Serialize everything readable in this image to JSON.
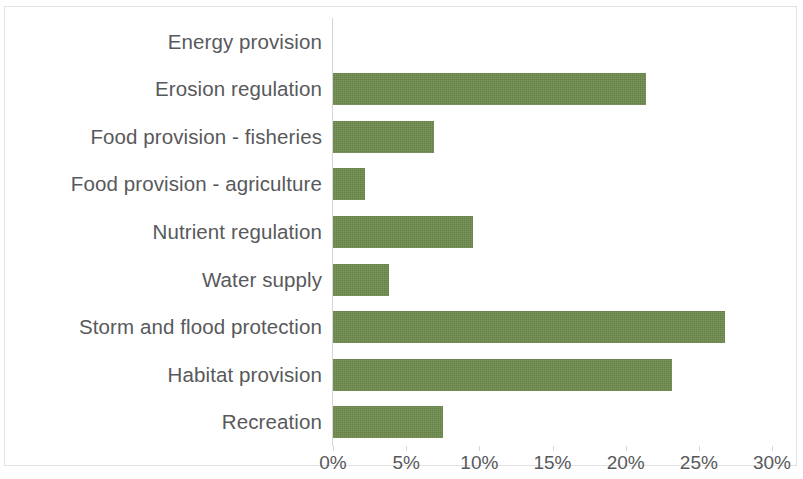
{
  "chart_data": {
    "type": "bar",
    "orientation": "horizontal",
    "title": "",
    "subtitle": "",
    "xlabel": "",
    "ylabel": "",
    "xlim": [
      0,
      30
    ],
    "xtick_labels": [
      "0%",
      "5%",
      "10%",
      "15%",
      "20%",
      "25%",
      "30%"
    ],
    "xticks": [
      0,
      5,
      10,
      15,
      20,
      25,
      30
    ],
    "units": "%",
    "grid": false,
    "legend": false,
    "legend_position": "none",
    "bar_color": "#6d8b4c",
    "text_color": "#58595b",
    "axis_color": "#d6d6d6",
    "categories": [
      "Energy provision",
      "Erosion regulation",
      "Food provision - fisheries",
      "Food provision - agriculture",
      "Nutrient regulation",
      "Water supply",
      "Storm and flood protection",
      "Habitat provision",
      "Recreation"
    ],
    "values": [
      0,
      21.4,
      6.9,
      2.2,
      9.6,
      3.8,
      26.8,
      23.2,
      7.5
    ],
    "value_labels": [
      "0%",
      "21.4%",
      "6.9%",
      "2.2%",
      "9.6%",
      "3.8%",
      "26.8%",
      "23.2%",
      "7.5%"
    ],
    "show_value_labels": false
  }
}
